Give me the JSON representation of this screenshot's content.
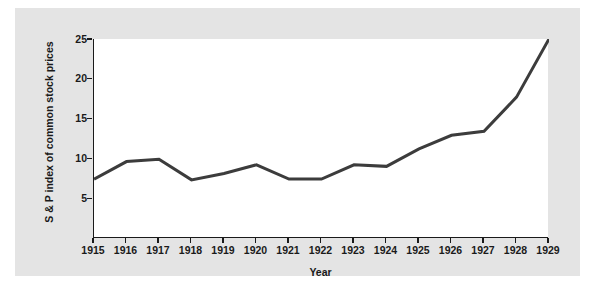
{
  "chart_data": {
    "type": "line",
    "title": "",
    "xlabel": "Year",
    "ylabel": "S & P index of common stock prices",
    "x": [
      1915,
      1916,
      1917,
      1918,
      1919,
      1920,
      1921,
      1922,
      1923,
      1924,
      1925,
      1926,
      1927,
      1928,
      1929
    ],
    "values": [
      7.4,
      9.6,
      9.9,
      7.3,
      8.1,
      9.2,
      7.4,
      7.4,
      9.2,
      9.0,
      11.2,
      12.9,
      13.4,
      17.7,
      25.0
    ],
    "series": [
      {
        "name": "S & P index of common stock prices",
        "values": [
          7.4,
          9.6,
          9.9,
          7.3,
          8.1,
          9.2,
          7.4,
          7.4,
          9.2,
          9.0,
          11.2,
          12.9,
          13.4,
          17.7,
          25.0
        ]
      }
    ],
    "xlim": [
      1915,
      1929
    ],
    "ylim": [
      0,
      25
    ],
    "xticks": [
      1915,
      1916,
      1917,
      1918,
      1919,
      1920,
      1921,
      1922,
      1923,
      1924,
      1925,
      1926,
      1927,
      1928,
      1929
    ],
    "xtick_labels": [
      "1915",
      "1916",
      "1917",
      "1918",
      "1919",
      "1920",
      "1921",
      "1922",
      "1923",
      "1924",
      "1925",
      "1926",
      "1927",
      "1928",
      "1929"
    ],
    "yticks": [
      5,
      10,
      15,
      20,
      25
    ],
    "ytick_labels": [
      "5",
      "10",
      "15",
      "20",
      "25"
    ],
    "grid": false,
    "legend": false,
    "legend_position": "none",
    "line_color": "#3c3c3c",
    "line_width": 3,
    "plot_background": "#ffffff",
    "panel_background": "#e4e4e4",
    "axis_color": "#1a1a1a",
    "text_color": "#1a1a1a"
  }
}
